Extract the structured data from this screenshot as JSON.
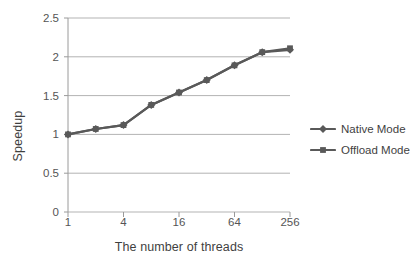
{
  "chart_data": {
    "type": "line",
    "title": "",
    "xlabel": "The number of threads",
    "ylabel": "Speedup",
    "x": [
      1,
      2,
      4,
      8,
      16,
      32,
      64,
      128,
      256
    ],
    "x_scale": "log2",
    "xtick_labels": [
      "1",
      "4",
      "16",
      "64",
      "256"
    ],
    "xtick_values": [
      1,
      4,
      16,
      64,
      256
    ],
    "ytick_labels": [
      "0",
      "0.5",
      "1",
      "1.5",
      "2",
      "2.5"
    ],
    "ytick_values": [
      0,
      0.5,
      1,
      1.5,
      2,
      2.5
    ],
    "ylim": [
      0,
      2.5
    ],
    "grid": "horizontal",
    "legend_position": "right",
    "series": [
      {
        "name": "Native Mode",
        "marker": "diamond",
        "color": "#595959",
        "values": [
          1.0,
          1.07,
          1.12,
          1.38,
          1.54,
          1.7,
          1.89,
          2.06,
          2.09
        ]
      },
      {
        "name": "Offload Mode",
        "marker": "square",
        "color": "#595959",
        "values": [
          1.0,
          1.07,
          1.12,
          1.38,
          1.54,
          1.7,
          1.89,
          2.06,
          2.11
        ]
      }
    ]
  },
  "axes": {
    "ylabel_text": "Speedup",
    "xlabel_text": "The number of threads"
  },
  "legend": {
    "items": [
      {
        "label": "Native Mode"
      },
      {
        "label": "Offload Mode"
      }
    ]
  },
  "colors": {
    "series": "#595959",
    "grid": "#b3b3b3",
    "axis": "#9a9a9a",
    "text": "#3f3f3f",
    "background": "#ffffff"
  }
}
